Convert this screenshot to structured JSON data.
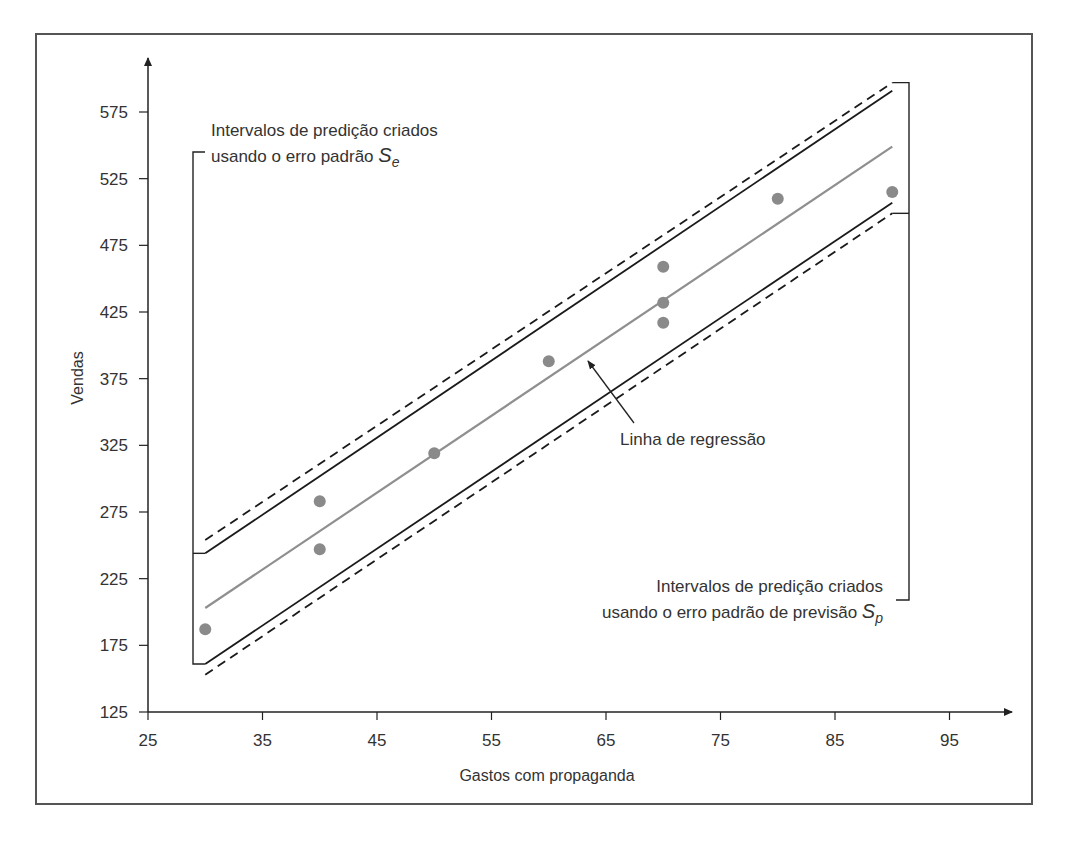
{
  "chart_data": {
    "type": "scatter",
    "title": "",
    "xlabel": "Gastos com propaganda",
    "ylabel": "Vendas",
    "xlim": [
      25,
      100
    ],
    "ylim": [
      125,
      600
    ],
    "x_ticks": [
      25,
      35,
      45,
      55,
      65,
      75,
      85,
      95
    ],
    "y_ticks": [
      125,
      175,
      225,
      275,
      325,
      375,
      425,
      475,
      525,
      575
    ],
    "grid": false,
    "legend": null,
    "points": [
      {
        "x": 30,
        "y": 187
      },
      {
        "x": 40,
        "y": 283
      },
      {
        "x": 40,
        "y": 247
      },
      {
        "x": 50,
        "y": 319
      },
      {
        "x": 60,
        "y": 388
      },
      {
        "x": 70,
        "y": 459
      },
      {
        "x": 70,
        "y": 432
      },
      {
        "x": 70,
        "y": 417
      },
      {
        "x": 80,
        "y": 510
      },
      {
        "x": 90,
        "y": 515
      }
    ],
    "series": [
      {
        "name": "Linha de regressão",
        "style": "solid-gray",
        "x": [
          30,
          90
        ],
        "y": [
          203,
          549
        ]
      },
      {
        "name": "Limite superior (S_e)",
        "style": "solid-black",
        "x": [
          30,
          90
        ],
        "y": [
          244,
          591
        ]
      },
      {
        "name": "Limite inferior (S_e)",
        "style": "solid-black",
        "x": [
          30,
          90
        ],
        "y": [
          161,
          507
        ]
      },
      {
        "name": "Limite superior (S_p)",
        "style": "dashed-black",
        "x": [
          30,
          90
        ],
        "y": [
          254,
          597
        ]
      },
      {
        "name": "Limite inferior (S_p)",
        "style": "dashed-black",
        "x": [
          30,
          90
        ],
        "y": [
          153,
          499
        ]
      }
    ],
    "annotations": [
      {
        "text_line1": "Intervalos de predição criados",
        "text_line2": "usando o erro padrão",
        "symbol": "S",
        "subscript": "e",
        "position": "upper-left",
        "bracket": "left"
      },
      {
        "text": "Linha de regressão",
        "arrow_to": {
          "x": 63,
          "y": 388
        }
      },
      {
        "text_line1": "Intervalos de predição criados",
        "text_line2": "usando o erro padrão de previsão",
        "symbol": "S",
        "subscript": "p",
        "position": "lower-right",
        "bracket": "right"
      }
    ]
  },
  "labels": {
    "xlabel": "Gastos com propaganda",
    "ylabel": "Vendas",
    "se_line1": "Intervalos de predição criados",
    "se_line2": "usando o erro padrão ",
    "se_symbol": "S",
    "se_sub": "e",
    "reg_label": "Linha de regressão",
    "sp_line1": "Intervalos de predição criados",
    "sp_line2": "usando o erro padrão de previsão ",
    "sp_symbol": "S",
    "sp_sub": "p"
  },
  "colors": {
    "axis": "#222222",
    "points": "#8a8a8a",
    "regression": "#8f8f8f",
    "bands": "#1a1a1a",
    "frame": "#555555"
  }
}
